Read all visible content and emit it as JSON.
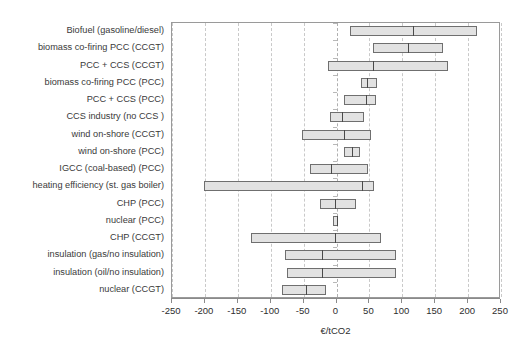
{
  "title_sliver": "",
  "axis": {
    "xlabel": "€/tCO2",
    "xmin": -250,
    "xmax": 250,
    "xstep": 50,
    "xticks": [
      "-250",
      "-200",
      "-150",
      "-100",
      "-50",
      "0",
      "50",
      "100",
      "150",
      "200",
      "250"
    ]
  },
  "style": {
    "box_fill": "#e2e2e2",
    "box_stroke": "#6f6f6f",
    "median_stroke": "#4a4a4a",
    "grid_color": "#c9c9c9",
    "frame_color": "#9a9a9a",
    "text_color": "#2e2e2e"
  },
  "chart_data": {
    "type": "bar",
    "subtype": "box-range-with-median",
    "title": "",
    "xlabel": "€/tCO2",
    "ylabel": "",
    "xlim": [
      -250,
      250
    ],
    "grid": true,
    "legend": "none",
    "orientation": "horizontal",
    "categories": [
      "Biofuel (gasoline/diesel)",
      "biomass co-firing PCC (CCGT)",
      "PCC + CCS (CCGT)",
      "biomass co-firing PCC (PCC)",
      "PCC + CCS (PCC)",
      "CCS industry (no CCS )",
      "wind on-shore (CCGT)",
      "wind on-shore (PCC)",
      "IGCC (coal-based) (PCC)",
      "heating efficiency (st. gas boiler)",
      "CHP (PCC)",
      "nuclear (PCC)",
      "CHP (CCGT)",
      "insulation (gas/no insulation)",
      "insulation (oil/no insulation)",
      "nuclear (CCGT)"
    ],
    "series": [
      {
        "name": "low",
        "values": [
          21,
          55,
          -13,
          37,
          12,
          -10,
          -53,
          12,
          -40,
          -202,
          -25,
          -5,
          -130,
          -78,
          -75,
          -83
        ]
      },
      {
        "name": "median",
        "values": [
          116,
          108,
          55,
          47,
          45,
          8,
          12,
          23,
          -8,
          38,
          -3,
          0,
          -2,
          -22,
          -22,
          -47
        ]
      },
      {
        "name": "high",
        "values": [
          214,
          162,
          170,
          62,
          60,
          42,
          52,
          35,
          48,
          57,
          30,
          3,
          68,
          90,
          90,
          -16
        ]
      }
    ]
  }
}
